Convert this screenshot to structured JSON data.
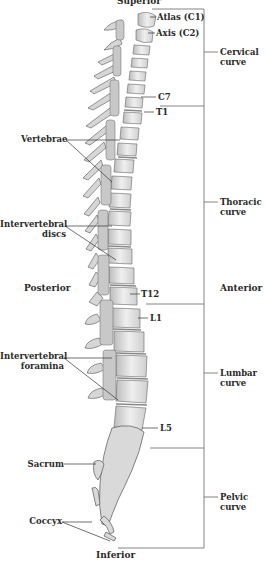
{
  "orientation": {
    "superior": "Superior",
    "inferior": "Inferior",
    "posterior": "Posterior",
    "anterior": "Anterior"
  },
  "vertebra_labels": {
    "atlas": "Atlas (C1)",
    "axis": "Axis (C2)",
    "c7": "C7",
    "t1": "T1",
    "t12": "T12",
    "l1": "L1",
    "l5": "L5"
  },
  "structure_labels": {
    "vertebrae": "Vertebrae",
    "discs_line1": "Intervertebral",
    "discs_line2": "discs",
    "foramina_line1": "Intervertebral",
    "foramina_line2": "foramina",
    "sacrum": "Sacrum",
    "coccyx": "Coccyx"
  },
  "curves": [
    {
      "line1": "Cervical",
      "line2": "curve"
    },
    {
      "line1": "Thoracic",
      "line2": "curve"
    },
    {
      "line1": "Lumbar",
      "line2": "curve"
    },
    {
      "line1": "Pelvic",
      "line2": "curve"
    }
  ],
  "colors": {
    "bone_fill": "#e4e4e4",
    "bone_shade": "#a8a8a8",
    "bone_outline": "#555555",
    "leader_line": "#333333",
    "bracket": "#777777"
  }
}
